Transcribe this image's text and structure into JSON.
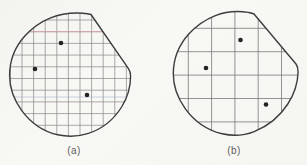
{
  "figure": {
    "background": "#f6f6f2",
    "outline_color": "#3d3d3d",
    "dot_color": "#232323",
    "accent_pink": "#d9a2a8",
    "accent_blue": "#9aa6cc",
    "panels": [
      {
        "id": "a",
        "label": "(a)",
        "grid": {
          "x_start": 10.4,
          "x_step": 11.6,
          "x_count": 11,
          "y_start": 20.0,
          "y_step": 11.7,
          "y_count": 10,
          "color": "#878787",
          "width": 0.7
        },
        "outline": "M91,14.5 L128.3,68.3 C129.8,70.5 130.6,73.2 130.6,76 C130.6,86.5 127.6,97.5 121.6,107 C113.8,119.5 101.8,129 88.4,133.4 C78.4,136.7 67.6,137 57.6,134.8 C43.6,131.6 30.8,123 21.6,110.4 C13.8,99.8 9.6,87.6 9.6,75.6 C9.6,60.8 15,46.8 24.8,36 C31.8,28.2 40.6,21.8 50.6,17.8 C61,13.6 72.4,12.6 82.6,13.2 C85.4,13.4 88.6,13.8 91,14.5 Z",
        "special_lines": [
          {
            "type": "h",
            "pos": 31.7,
            "color_key": "accent_pink",
            "opacity": 0.85
          },
          {
            "type": "h",
            "pos": 97.0,
            "color_key": "accent_blue",
            "opacity": 0.55
          }
        ],
        "dots": [
          [
            61,
            43
          ],
          [
            35,
            69
          ],
          [
            87,
            95
          ]
        ]
      },
      {
        "id": "b",
        "label": "(b)",
        "grid": {
          "x_start": 188.3,
          "x_step": 23.3,
          "x_count": 5,
          "y_start": 28.3,
          "y_step": 23.4,
          "y_count": 5,
          "color": "#787878",
          "width": 0.8
        },
        "outline": "M254,14 L296,64 C297.5,66.2 298.2,69 298.1,72 C297.8,83 294.3,94 287.8,104 C279.8,116.5 267.6,126.2 254.2,131.6 C243.8,135.7 232.6,136.2 222.2,133.8 C207.8,130.4 194.6,121.6 185.2,108.6 C177.4,97.8 173.2,85.6 173.3,73.6 C173.4,58.8 179,44.8 189,33.8 C196.2,26 205.2,19.6 215.4,15.6 C226,11.4 237.6,10.6 248.2,12.4 C250.2,12.8 252.4,13.2 254,14 Z",
        "special_lines": [],
        "dots": [
          [
            240.5,
            40
          ],
          [
            206,
            68
          ],
          [
            266,
            104.5
          ]
        ]
      }
    ]
  }
}
